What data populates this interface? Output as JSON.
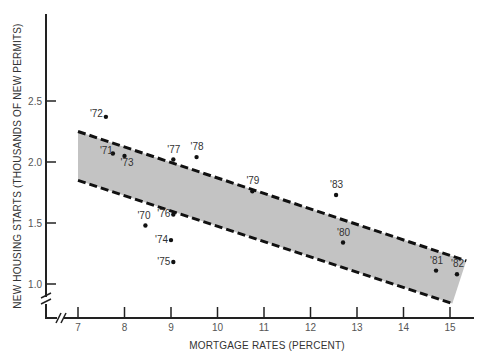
{
  "chart_data": {
    "type": "scatter",
    "title": "",
    "xlabel": "MORTGAGE RATES (PERCENT)",
    "ylabel": "NEW HOUSING STARTS (THOUSANDS OF NEW PERMITS)",
    "xlim": [
      7,
      15.4
    ],
    "ylim": [
      0.85,
      3.0
    ],
    "x_ticks": [
      7,
      8,
      9,
      10,
      11,
      12,
      13,
      14,
      15
    ],
    "y_ticks": [
      1.0,
      1.5,
      2.0,
      2.5
    ],
    "y_tick_labels": [
      "1.0",
      "1.5",
      "2.0",
      "2.5"
    ],
    "axis_breaks": true,
    "grid": false,
    "legend": null,
    "points": [
      {
        "label": "'70",
        "x": 8.45,
        "y": 1.48
      },
      {
        "label": "'71",
        "x": 7.75,
        "y": 2.07
      },
      {
        "label": "'72",
        "x": 7.6,
        "y": 2.37
      },
      {
        "label": "'73",
        "x": 8.0,
        "y": 2.05
      },
      {
        "label": "'74",
        "x": 9.0,
        "y": 1.36
      },
      {
        "label": "'75",
        "x": 9.05,
        "y": 1.18
      },
      {
        "label": "'76",
        "x": 9.05,
        "y": 1.57
      },
      {
        "label": "'77",
        "x": 9.05,
        "y": 2.02
      },
      {
        "label": "'78",
        "x": 9.55,
        "y": 2.04
      },
      {
        "label": "'79",
        "x": 10.75,
        "y": 1.76
      },
      {
        "label": "'80",
        "x": 12.7,
        "y": 1.34
      },
      {
        "label": "'81",
        "x": 14.7,
        "y": 1.11
      },
      {
        "label": "'82",
        "x": 15.15,
        "y": 1.08
      },
      {
        "label": "'83",
        "x": 12.55,
        "y": 1.73
      }
    ],
    "band": {
      "description": "shaded trend band with dashed borders",
      "upper": [
        {
          "x": 7,
          "y": 2.25
        },
        {
          "x": 15.35,
          "y": 1.19
        }
      ],
      "lower": [
        {
          "x": 7,
          "y": 1.85
        },
        {
          "x": 15.05,
          "y": 0.84
        }
      ],
      "fill": "#c3c3c3"
    }
  },
  "colors": {
    "axis": "#222222",
    "band_fill": "#c3c3c3",
    "dash": "#111111",
    "point": "#111111"
  }
}
